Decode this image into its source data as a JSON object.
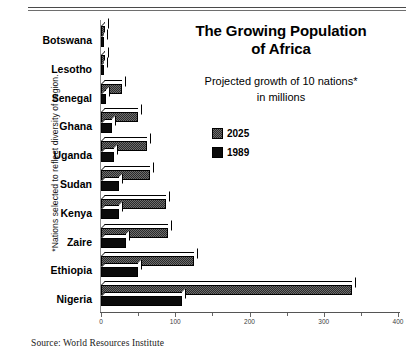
{
  "header": {
    "title_line1": "The Growing Population",
    "title_line2": "of Africa",
    "subtitle_line1": "Projected growth of 10 nations*",
    "subtitle_line2": "in millions"
  },
  "footnote": {
    "side_note": "*Nations selected to reflect diversity of region.",
    "source": "Source: World Resources Institute"
  },
  "legend": {
    "items": [
      {
        "label": "2025",
        "color": "#6d6d6d",
        "pattern": "dither"
      },
      {
        "label": "1989",
        "color": "#0b0b0b",
        "pattern": "solid"
      }
    ]
  },
  "chart_data": {
    "type": "bar",
    "orientation": "horizontal",
    "title": "The Growing Population of Africa",
    "subtitle": "Projected growth of 10 nations* in millions",
    "xlabel": "",
    "ylabel": "",
    "xlim": [
      0,
      400
    ],
    "xticks": [
      0,
      100,
      200,
      300,
      400
    ],
    "xtick_labels": [
      "0",
      "100",
      "200",
      "300",
      "400"
    ],
    "grid": false,
    "legend_position": "upper-right-panel",
    "categories": [
      "Botswana",
      "Lesotho",
      "Senegal",
      "Ghana",
      "Uganda",
      "Sudan",
      "Kenya",
      "Zaire",
      "Ethiopia",
      "Nigeria"
    ],
    "series": [
      {
        "name": "2025",
        "values": [
          5,
          6,
          28,
          50,
          62,
          66,
          88,
          90,
          125,
          338
        ]
      },
      {
        "name": "1989",
        "values": [
          1,
          2,
          7,
          15,
          17,
          24,
          24,
          34,
          50,
          109
        ]
      }
    ]
  }
}
